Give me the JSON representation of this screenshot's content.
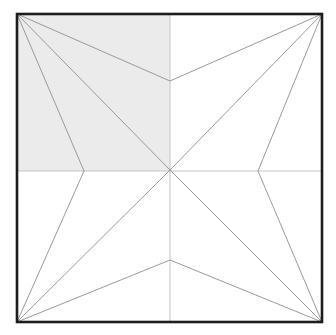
{
  "figure": {
    "canvas": {
      "width": 336,
      "height": 335,
      "background": "#ffffff"
    },
    "square": {
      "label": "outer-square",
      "left": 17,
      "top": 14,
      "right": 322,
      "bottom": 322,
      "stroke": "#1d1d1d",
      "stroke_width": 2.6,
      "fill": "none"
    },
    "center": {
      "label": "center-point",
      "x": 170,
      "y": 170
    },
    "corners": [
      {
        "name": "top-left",
        "x": 17,
        "y": 14
      },
      {
        "name": "top-right",
        "x": 322,
        "y": 14
      },
      {
        "name": "bottom-right",
        "x": 322,
        "y": 322
      },
      {
        "name": "bottom-left",
        "x": 17,
        "y": 322
      }
    ],
    "notches": [
      {
        "name": "top-notch",
        "x": 170,
        "y": 81
      },
      {
        "name": "right-notch",
        "x": 258,
        "y": 171
      },
      {
        "name": "bottom-notch",
        "x": 170,
        "y": 260
      },
      {
        "name": "left-notch",
        "x": 84,
        "y": 171
      }
    ],
    "midlines": {
      "stroke": "#bdbdbd",
      "stroke_width": 0.9,
      "horizontal": {
        "name": "horizontal-midline",
        "x1": 17,
        "y1": 171,
        "x2": 322,
        "y2": 171
      },
      "vertical": {
        "name": "vertical-midline",
        "x1": 170,
        "y1": 14,
        "x2": 170,
        "y2": 322
      }
    },
    "rays": {
      "stroke": "#9a9a9a",
      "stroke_width": 1.0,
      "segments": [
        {
          "name": "ray-top-left-to-center",
          "x1": 17,
          "y1": 14,
          "x2": 170,
          "y2": 170
        },
        {
          "name": "ray-top-left-to-top-notch",
          "x1": 17,
          "y1": 14,
          "x2": 170,
          "y2": 81
        },
        {
          "name": "ray-top-left-to-left-notch",
          "x1": 17,
          "y1": 14,
          "x2": 84,
          "y2": 171
        },
        {
          "name": "ray-top-right-to-center",
          "x1": 322,
          "y1": 14,
          "x2": 170,
          "y2": 170
        },
        {
          "name": "ray-top-right-to-top-notch",
          "x1": 322,
          "y1": 14,
          "x2": 170,
          "y2": 81
        },
        {
          "name": "ray-top-right-to-right-notch",
          "x1": 322,
          "y1": 14,
          "x2": 258,
          "y2": 171
        },
        {
          "name": "ray-bottom-right-to-center",
          "x1": 322,
          "y1": 322,
          "x2": 170,
          "y2": 170
        },
        {
          "name": "ray-bottom-right-to-right-notch",
          "x1": 322,
          "y1": 322,
          "x2": 258,
          "y2": 171
        },
        {
          "name": "ray-bottom-right-to-bottom-notch",
          "x1": 322,
          "y1": 322,
          "x2": 170,
          "y2": 260
        },
        {
          "name": "ray-bottom-left-to-center",
          "x1": 17,
          "y1": 322,
          "x2": 170,
          "y2": 170
        },
        {
          "name": "ray-bottom-left-to-bottom-notch",
          "x1": 17,
          "y1": 322,
          "x2": 170,
          "y2": 260
        },
        {
          "name": "ray-bottom-left-to-left-notch",
          "x1": 17,
          "y1": 322,
          "x2": 84,
          "y2": 171
        }
      ]
    },
    "shaded_region": {
      "name": "shaded-top-left-quadrant",
      "fill": "#ebebeb",
      "points": "17,14 170,14 170,171 17,171",
      "description": "top-left quadrant filled light gray"
    }
  }
}
